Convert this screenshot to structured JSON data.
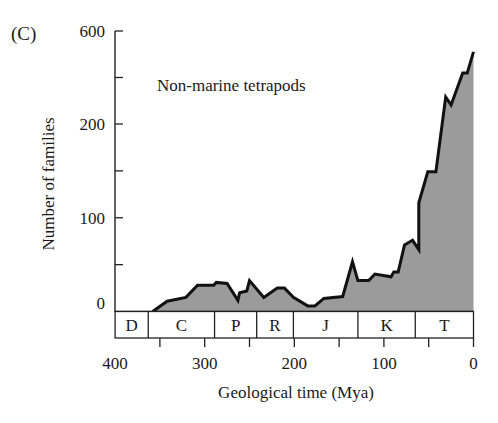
{
  "panel_label": "(C)",
  "chart_data": {
    "type": "area",
    "title": "Non-marine tetrapods",
    "annotation": "Non-marine tetrapods",
    "xlabel": "Geological time (Mya)",
    "ylabel": "Number of families",
    "xlim": [
      400,
      0
    ],
    "x_reversed": true,
    "ylim": [
      0,
      600
    ],
    "y_scale_note": "broken scale: 0-200 linear, 200-600 compressed",
    "x_ticks": [
      400,
      350,
      300,
      250,
      200,
      150,
      100,
      50,
      0
    ],
    "x_tick_labels": [
      "400",
      "",
      "300",
      "",
      "200",
      "",
      "100",
      "",
      "0"
    ],
    "y_ticks": [
      0,
      50,
      100,
      150,
      200,
      400,
      600
    ],
    "y_tick_labels": [
      "0",
      "",
      "100",
      "",
      "200",
      "",
      "600"
    ],
    "grid": false,
    "legend": null,
    "series": [
      {
        "name": "Non-marine tetrapods",
        "fill": "#9b9b9b",
        "stroke": "#111111",
        "x": [
          358,
          342,
          321,
          308,
          290,
          287,
          275,
          263,
          261,
          253,
          250,
          234,
          219,
          211,
          201,
          185,
          177,
          167,
          146,
          135,
          129,
          117,
          110,
          92,
          89,
          84,
          77,
          68,
          61,
          61,
          51,
          42,
          31,
          25,
          12,
          7,
          0
        ],
        "y": [
          0,
          11,
          15,
          28,
          28,
          31,
          30,
          12,
          20,
          22,
          33,
          15,
          25,
          25,
          15,
          6,
          6,
          14,
          16,
          53,
          33,
          33,
          40,
          37,
          42,
          42,
          71,
          76,
          66,
          116,
          149,
          149,
          316,
          282,
          419,
          419,
          510
        ]
      }
    ],
    "periods": [
      {
        "label": "D",
        "start": 400,
        "end": 363
      },
      {
        "label": "C",
        "start": 363,
        "end": 289
      },
      {
        "label": "P",
        "start": 289,
        "end": 242
      },
      {
        "label": "R",
        "start": 242,
        "end": 201
      },
      {
        "label": "J",
        "start": 201,
        "end": 129
      },
      {
        "label": "K",
        "start": 129,
        "end": 65
      },
      {
        "label": "T",
        "start": 65,
        "end": 0
      }
    ]
  }
}
